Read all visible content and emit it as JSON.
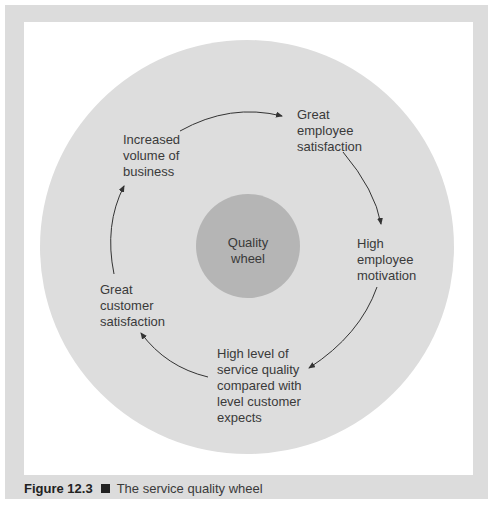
{
  "figure": {
    "number_label": "Figure 12.3",
    "title": "The service quality wheel"
  },
  "diagram": {
    "center_label": "Quality\nwheel",
    "colors": {
      "frame": "#dcdcdc",
      "panel": "#ffffff",
      "outer_circle": "#dddddd",
      "inner_circle": "#b5b5b5",
      "arrow": "#333333",
      "text": "#3a3a3a"
    },
    "cycle_nodes": [
      {
        "id": "great-employee-satisfaction",
        "label": "Great\nemployee\nsatisfaction"
      },
      {
        "id": "high-employee-motivation",
        "label": "High\nemployee\nmotivation"
      },
      {
        "id": "high-service-quality",
        "label": "High level of\nservice quality\ncompared with\nlevel customer\nexpects"
      },
      {
        "id": "great-customer-satisfaction",
        "label": "Great\ncustomer\nsatisfaction"
      },
      {
        "id": "increased-volume-of-business",
        "label": "Increased\nvolume of\nbusiness"
      }
    ]
  }
}
